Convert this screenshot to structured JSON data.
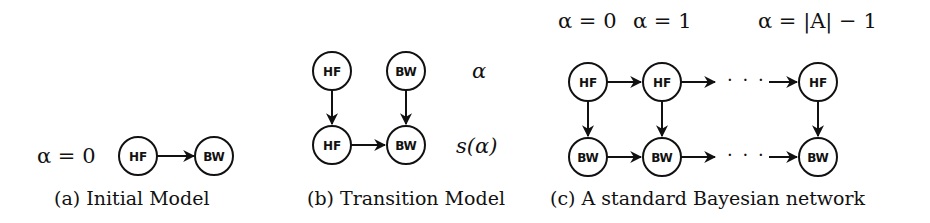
{
  "figure": {
    "panels": [
      {
        "id": "a",
        "caption": "(a) Initial Model",
        "labels": {
          "alpha": "α = 0"
        },
        "nodes": [
          {
            "label": "HF"
          },
          {
            "label": "BW"
          }
        ],
        "edges": [
          {
            "from": "HF",
            "to": "BW"
          }
        ]
      },
      {
        "id": "b",
        "caption": "(b) Transition Model",
        "labels": {
          "top_row": "α",
          "bottom_row": "s(α)"
        },
        "nodes": [
          {
            "label": "HF"
          },
          {
            "label": "BW"
          },
          {
            "label": "HF"
          },
          {
            "label": "BW"
          }
        ],
        "edges": [
          {
            "from": "HF (α)",
            "to": "HF (s(α))"
          },
          {
            "from": "BW (α)",
            "to": "BW (s(α))"
          },
          {
            "from": "HF (s(α))",
            "to": "BW (s(α))"
          }
        ]
      },
      {
        "id": "c",
        "caption": "(c) A standard Bayesian network",
        "labels": {
          "col0": "α = 0",
          "col1": "α = 1",
          "col_last": "α = |A| − 1"
        },
        "ellipsis": "· · ·",
        "nodes": [
          {
            "label": "HF"
          },
          {
            "label": "HF"
          },
          {
            "label": "HF"
          },
          {
            "label": "BW"
          },
          {
            "label": "BW"
          },
          {
            "label": "BW"
          }
        ],
        "edges": [
          {
            "from": "HF₀",
            "to": "HF₁"
          },
          {
            "from": "HF₁",
            "to": "…"
          },
          {
            "from": "…",
            "to": "HF_last"
          },
          {
            "from": "BW₀",
            "to": "BW₁"
          },
          {
            "from": "BW₁",
            "to": "…"
          },
          {
            "from": "…",
            "to": "BW_last"
          },
          {
            "from": "HF₀",
            "to": "BW₀"
          },
          {
            "from": "HF₁",
            "to": "BW₁"
          },
          {
            "from": "HF_last",
            "to": "BW_last"
          }
        ]
      }
    ],
    "colors": {
      "stroke": "#111111",
      "background": "#ffffff"
    }
  }
}
